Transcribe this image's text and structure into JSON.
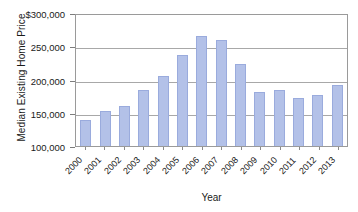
{
  "chart_data": {
    "type": "bar",
    "title": "",
    "xlabel": "Year",
    "ylabel": "Median Existing Home Price",
    "categories": [
      "2000",
      "2001",
      "2002",
      "2003",
      "2004",
      "2005",
      "2006",
      "2007",
      "2008",
      "2009",
      "2010",
      "2011",
      "2012",
      "2013"
    ],
    "values": [
      139000,
      153000,
      160000,
      184000,
      206000,
      237000,
      265000,
      259000,
      224000,
      181000,
      184000,
      172000,
      176000,
      192000
    ],
    "ylim": [
      100000,
      300000
    ],
    "ytick_labels": [
      "$300,000",
      "250,000",
      "200,000",
      "150,000",
      "100,000"
    ],
    "ytick_values": [
      300000,
      250000,
      200000,
      150000,
      100000
    ],
    "grid": true,
    "legend": "none",
    "bar_color": "#b3c1e8",
    "bar_border_color": "#9aabdd",
    "axis_color": "#9a9a9a",
    "gridline_color": "#a8a8a8",
    "text_color": "#1a1a1a"
  }
}
